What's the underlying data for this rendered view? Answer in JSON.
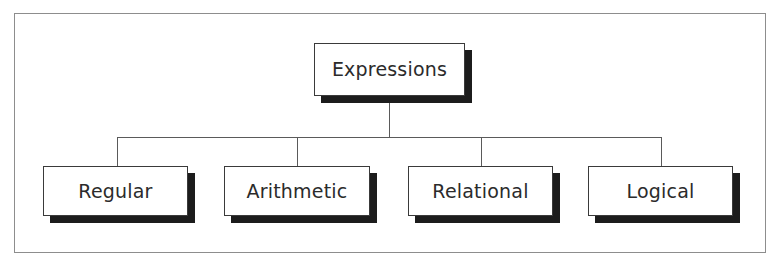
{
  "diagram": {
    "title": "Expressions",
    "type": "hierarchy-tree",
    "frame": {
      "border_color": "#8d8d8d",
      "background": "#ffffff"
    },
    "style": {
      "box_fill": "#ffffff",
      "box_border_color": "#3a3a3a",
      "shadow_color": "#1c1c1c",
      "connector_color": "#5a5a5a",
      "text_color": "#2b2b2b"
    },
    "root": {
      "label": "Expressions"
    },
    "children": [
      {
        "label": "Regular"
      },
      {
        "label": "Arithmetic"
      },
      {
        "label": "Relational"
      },
      {
        "label": "Logical"
      }
    ]
  }
}
